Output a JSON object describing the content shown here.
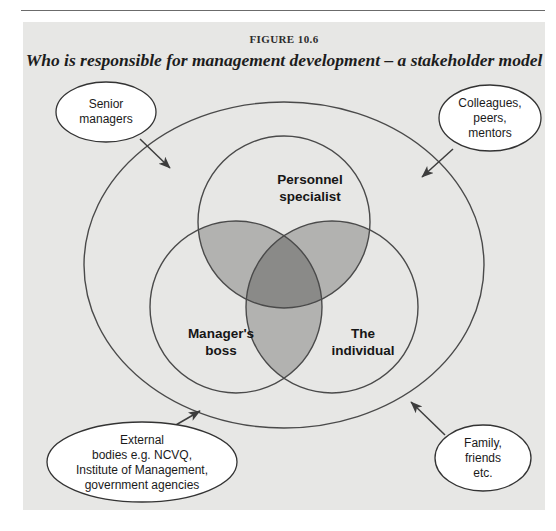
{
  "figure": {
    "number": "FIGURE 10.6",
    "title": "Who is responsible for management development – a stakeholder model"
  },
  "colors": {
    "panel_background": "#e7e7e5",
    "stroke": "#4a4a4a",
    "overlap_two": "#b2b2b0",
    "overlap_three": "#8a8a88",
    "callout_fill": "#ffffff",
    "text": "#161616"
  },
  "diagram": {
    "type": "venn-stakeholder-model",
    "outer_boundary": {
      "shape": "ellipse",
      "label": ""
    },
    "circles": [
      {
        "id": "personnel-specialist",
        "label_lines": [
          "Personnel",
          "specialist"
        ],
        "position": "top"
      },
      {
        "id": "managers-boss",
        "label_lines": [
          "Manager's",
          "boss"
        ],
        "position": "bottom-left"
      },
      {
        "id": "the-individual",
        "label_lines": [
          "The",
          "individual"
        ],
        "position": "bottom-right"
      }
    ],
    "callouts": [
      {
        "id": "senior-managers",
        "lines": [
          "Senior",
          "managers"
        ],
        "position": "top-left",
        "arrow": "points down-right toward outer ellipse"
      },
      {
        "id": "colleagues-peers-mentors",
        "lines": [
          "Colleagues,",
          "peers,",
          "mentors"
        ],
        "position": "top-right",
        "arrow": "points down-left toward outer ellipse"
      },
      {
        "id": "external-bodies",
        "lines": [
          "External",
          "bodies e.g. NCVQ,",
          "Institute of Management,",
          "government agencies"
        ],
        "position": "bottom-left",
        "arrow": "points up-right toward outer ellipse"
      },
      {
        "id": "family-friends",
        "lines": [
          "Family,",
          "friends",
          "etc."
        ],
        "position": "bottom-right",
        "arrow": "points up-left toward outer ellipse"
      }
    ]
  }
}
